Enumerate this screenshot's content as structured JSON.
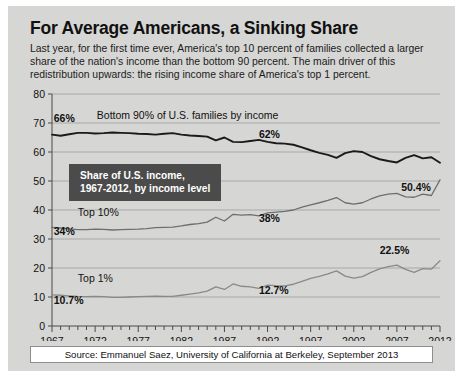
{
  "headline": "For Average Americans, a Sinking Share",
  "deck": "Last year, for the first time ever, America's top 10 percent of families collected a larger share of the nation's income than the bottom 90 percent. The main driver of this redistribution upwards: the rising income share of America's top 1 percent.",
  "callout": "Share of U.S. income,\n1967-2012, by income level",
  "source": "Source: Emmanuel Saez, University of California at Berkeley, September 2013",
  "colors": {
    "card_background": "#d6d6d4",
    "callout_background": "#4b4b4b",
    "callout_text": "#ffffff",
    "bottom90_line": "#1a1a1a",
    "top10_line": "#6e6e6e",
    "top1_line": "#8a8a8a",
    "gridline": "#a8a8a6",
    "axis": "#4a4a4a",
    "source_box": "#ffffff"
  },
  "chart_data": {
    "type": "line",
    "title": "For Average Americans, a Sinking Share",
    "subtitle": "Share of U.S. income, 1967-2012, by income level",
    "xlabel": "",
    "ylabel": "",
    "xlim": [
      1967,
      2012
    ],
    "ylim": [
      0,
      80
    ],
    "yticks": [
      0,
      10,
      20,
      30,
      40,
      50,
      60,
      70,
      80
    ],
    "xticks": [
      1967,
      1972,
      1977,
      1982,
      1987,
      1992,
      1997,
      2002,
      2007,
      2012
    ],
    "xtick_minor_step": 1,
    "grid": true,
    "legend": "inline-labels",
    "x": [
      1967,
      1968,
      1969,
      1970,
      1971,
      1972,
      1973,
      1974,
      1975,
      1976,
      1977,
      1978,
      1979,
      1980,
      1981,
      1982,
      1983,
      1984,
      1985,
      1986,
      1987,
      1988,
      1989,
      1990,
      1991,
      1992,
      1993,
      1994,
      1995,
      1996,
      1997,
      1998,
      1999,
      2000,
      2001,
      2002,
      2003,
      2004,
      2005,
      2006,
      2007,
      2008,
      2009,
      2010,
      2011,
      2012
    ],
    "series": [
      {
        "name": "Bottom 90% of U.S. families by income",
        "color": "#1a1a1a",
        "values": [
          66.0,
          65.6,
          66.1,
          66.6,
          66.6,
          66.4,
          66.5,
          66.7,
          66.6,
          66.5,
          66.3,
          66.2,
          66.0,
          66.3,
          66.5,
          66.0,
          65.7,
          65.5,
          65.3,
          64.0,
          65.0,
          63.5,
          63.4,
          63.8,
          64.2,
          63.5,
          63.0,
          62.9,
          62.5,
          61.6,
          60.6,
          59.7,
          59.0,
          58.0,
          59.6,
          60.3,
          60.0,
          58.6,
          57.5,
          56.9,
          56.4,
          58.0,
          58.9,
          57.8,
          58.2,
          56.3
        ],
        "endpoint_label": "50.4%",
        "annotations": [
          {
            "x": 1967,
            "y": 66.0,
            "text": "66%"
          },
          {
            "x": 1992,
            "y": 63.5,
            "text": "62%"
          },
          {
            "x": 2012,
            "y": 56.3,
            "text": "50.4%"
          }
        ]
      },
      {
        "name": "Top 10%",
        "color": "#6e6e6e",
        "values": [
          34.0,
          33.8,
          33.5,
          33.2,
          33.2,
          33.4,
          33.3,
          33.1,
          33.2,
          33.3,
          33.4,
          33.6,
          33.9,
          34.0,
          34.1,
          34.5,
          35.0,
          35.3,
          35.8,
          37.5,
          36.2,
          38.5,
          38.2,
          38.4,
          38.0,
          39.0,
          39.3,
          39.5,
          40.0,
          41.0,
          41.8,
          42.5,
          43.3,
          44.3,
          42.5,
          42.0,
          42.5,
          43.8,
          44.9,
          45.5,
          45.7,
          44.5,
          44.4,
          45.5,
          45.0,
          50.4
        ],
        "endpoint_label": "50.4%",
        "annotations": [
          {
            "x": 1967,
            "y": 34.0,
            "text": "34%"
          },
          {
            "x": 1992,
            "y": 39.0,
            "text": "38%"
          }
        ]
      },
      {
        "name": "Top 1%",
        "color": "#8a8a8a",
        "values": [
          10.7,
          10.6,
          10.4,
          10.2,
          10.1,
          10.2,
          10.1,
          9.9,
          9.9,
          10.0,
          10.1,
          10.2,
          10.3,
          10.2,
          10.2,
          10.6,
          11.0,
          11.4,
          12.0,
          13.5,
          12.6,
          14.5,
          13.7,
          13.5,
          13.0,
          14.1,
          13.9,
          13.8,
          14.4,
          15.4,
          16.4,
          17.1,
          18.0,
          19.0,
          17.2,
          16.5,
          17.0,
          18.5,
          19.7,
          20.5,
          21.0,
          19.5,
          18.5,
          19.8,
          19.6,
          22.5
        ],
        "endpoint_label": "22.5%",
        "annotations": [
          {
            "x": 1967,
            "y": 10.7,
            "text": "10.7%"
          },
          {
            "x": 1992,
            "y": 14.1,
            "text": "12.7%"
          },
          {
            "x": 2012,
            "y": 22.5,
            "text": "22.5%"
          }
        ]
      }
    ],
    "inline_series_labels": [
      {
        "text": "Bottom 90% of U.S. families by income",
        "x": 1972.2,
        "y": 71.5
      },
      {
        "text": "Top 10%",
        "x": 1970.0,
        "y": 38.0
      },
      {
        "text": "Top 1%",
        "x": 1970.0,
        "y": 15.2
      }
    ],
    "value_labels": [
      {
        "text": "66%",
        "x": 1967.2,
        "y": 70.4,
        "anchor": "start"
      },
      {
        "text": "62%",
        "x": 1991.0,
        "y": 65.0,
        "anchor": "start"
      },
      {
        "text": "50.4%",
        "x": 2007.5,
        "y": 46.5,
        "anchor": "start"
      },
      {
        "text": "34%",
        "x": 1967.2,
        "y": 31.5,
        "anchor": "start"
      },
      {
        "text": "38%",
        "x": 1991.0,
        "y": 36.0,
        "anchor": "start"
      },
      {
        "text": "22.5%",
        "x": 2005.0,
        "y": 25.0,
        "anchor": "start"
      },
      {
        "text": "10.7%",
        "x": 1967.2,
        "y": 7.6,
        "anchor": "start"
      },
      {
        "text": "12.7%",
        "x": 1991.0,
        "y": 11.0,
        "anchor": "start"
      }
    ]
  }
}
